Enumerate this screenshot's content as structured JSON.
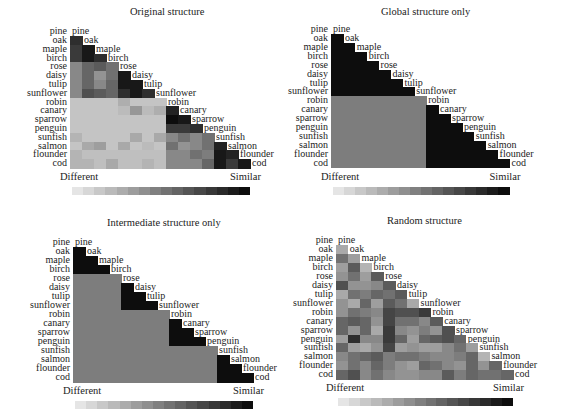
{
  "labels": [
    "pine",
    "oak",
    "maple",
    "birch",
    "rose",
    "daisy",
    "tulip",
    "sunflower",
    "robin",
    "canary",
    "sparrow",
    "penguin",
    "sunfish",
    "salmon",
    "flounder",
    "cod"
  ],
  "legend": {
    "left": "Different",
    "right": "Similar",
    "steps": 16
  },
  "colors": {
    "light": "#ececec",
    "dark": "#0d0d0d"
  },
  "panels": [
    {
      "title": "Original structure"
    },
    {
      "title": "Global structure only"
    },
    {
      "title": "Intermediate structure only"
    },
    {
      "title": "Random structure"
    }
  ],
  "chart_data": [
    {
      "type": "heatmap",
      "title": "Original structure",
      "layout": "lower-triangular similarity matrix",
      "row_labels": [
        "oak",
        "maple",
        "birch",
        "rose",
        "daisy",
        "tulip",
        "sunflower",
        "robin",
        "canary",
        "sparrow",
        "penguin",
        "sunfish",
        "salmon",
        "flounder",
        "cod"
      ],
      "col_labels": [
        "pine",
        "oak",
        "maple",
        "birch",
        "rose",
        "daisy",
        "tulip",
        "sunflower",
        "robin",
        "canary",
        "sparrow",
        "penguin",
        "sunfish",
        "salmon",
        "flounder"
      ],
      "scale": {
        "min_label": "Different",
        "max_label": "Similar",
        "range": [
          0,
          1
        ]
      },
      "values": [
        [
          0.85
        ],
        [
          0.8,
          0.95
        ],
        [
          0.8,
          0.95,
          0.85
        ],
        [
          0.45,
          0.6,
          0.65,
          0.55
        ],
        [
          0.45,
          0.6,
          0.4,
          0.55,
          0.95
        ],
        [
          0.45,
          0.6,
          0.45,
          0.6,
          0.95,
          0.95
        ],
        [
          0.45,
          0.7,
          0.65,
          0.6,
          0.85,
          0.95,
          0.85
        ],
        [
          0.18,
          0.18,
          0.18,
          0.18,
          0.28,
          0.18,
          0.18,
          0.18
        ],
        [
          0.18,
          0.18,
          0.18,
          0.18,
          0.22,
          0.38,
          0.22,
          0.28,
          0.9
        ],
        [
          0.18,
          0.18,
          0.18,
          0.18,
          0.18,
          0.18,
          0.18,
          0.18,
          1.0,
          0.95
        ],
        [
          0.18,
          0.18,
          0.18,
          0.18,
          0.18,
          0.18,
          0.18,
          0.18,
          0.8,
          0.8,
          0.85
        ],
        [
          0.25,
          0.18,
          0.18,
          0.18,
          0.18,
          0.3,
          0.18,
          0.3,
          0.45,
          0.55,
          0.45,
          0.55
        ],
        [
          0.18,
          0.3,
          0.35,
          0.18,
          0.3,
          0.18,
          0.22,
          0.18,
          0.55,
          0.4,
          0.45,
          0.55,
          0.9
        ],
        [
          0.25,
          0.2,
          0.2,
          0.2,
          0.2,
          0.2,
          0.2,
          0.2,
          0.45,
          0.45,
          0.55,
          0.5,
          0.95,
          0.9
        ],
        [
          0.25,
          0.25,
          0.2,
          0.3,
          0.2,
          0.2,
          0.25,
          0.2,
          0.45,
          0.45,
          0.45,
          0.6,
          0.95,
          0.8,
          0.95
        ]
      ]
    },
    {
      "type": "heatmap",
      "title": "Global structure only",
      "layout": "lower-triangular similarity matrix",
      "row_labels": [
        "oak",
        "maple",
        "birch",
        "rose",
        "daisy",
        "tulip",
        "sunflower",
        "robin",
        "canary",
        "sparrow",
        "penguin",
        "sunfish",
        "salmon",
        "flounder",
        "cod"
      ],
      "col_labels": [
        "pine",
        "oak",
        "maple",
        "birch",
        "rose",
        "daisy",
        "tulip",
        "sunflower",
        "robin",
        "canary",
        "sparrow",
        "penguin",
        "sunfish",
        "salmon",
        "flounder"
      ],
      "scale": {
        "min_label": "Different",
        "max_label": "Similar",
        "range": [
          0,
          1
        ]
      },
      "values": [
        [
          1
        ],
        [
          1,
          1
        ],
        [
          1,
          1,
          1
        ],
        [
          1,
          1,
          1,
          1
        ],
        [
          1,
          1,
          1,
          1,
          1
        ],
        [
          1,
          1,
          1,
          1,
          1,
          1
        ],
        [
          1,
          1,
          1,
          1,
          1,
          1,
          1
        ],
        [
          0.5,
          0.5,
          0.5,
          0.5,
          0.5,
          0.5,
          0.5,
          0.5
        ],
        [
          0.5,
          0.5,
          0.5,
          0.5,
          0.5,
          0.5,
          0.5,
          0.5,
          1
        ],
        [
          0.5,
          0.5,
          0.5,
          0.5,
          0.5,
          0.5,
          0.5,
          0.5,
          1,
          1
        ],
        [
          0.5,
          0.5,
          0.5,
          0.5,
          0.5,
          0.5,
          0.5,
          0.5,
          1,
          1,
          1
        ],
        [
          0.5,
          0.5,
          0.5,
          0.5,
          0.5,
          0.5,
          0.5,
          0.5,
          1,
          1,
          1,
          1
        ],
        [
          0.5,
          0.5,
          0.5,
          0.5,
          0.5,
          0.5,
          0.5,
          0.5,
          1,
          1,
          1,
          1,
          1
        ],
        [
          0.5,
          0.5,
          0.5,
          0.5,
          0.5,
          0.5,
          0.5,
          0.5,
          1,
          1,
          1,
          1,
          1,
          1
        ],
        [
          0.5,
          0.5,
          0.5,
          0.5,
          0.5,
          0.5,
          0.5,
          0.5,
          1,
          1,
          1,
          1,
          1,
          1,
          1
        ]
      ]
    },
    {
      "type": "heatmap",
      "title": "Intermediate structure only",
      "layout": "lower-triangular similarity matrix",
      "row_labels": [
        "oak",
        "maple",
        "birch",
        "rose",
        "daisy",
        "tulip",
        "sunflower",
        "robin",
        "canary",
        "sparrow",
        "penguin",
        "sunfish",
        "salmon",
        "flounder",
        "cod"
      ],
      "col_labels": [
        "pine",
        "oak",
        "maple",
        "birch",
        "rose",
        "daisy",
        "tulip",
        "sunflower",
        "robin",
        "canary",
        "sparrow",
        "penguin",
        "sunfish",
        "salmon",
        "flounder"
      ],
      "scale": {
        "min_label": "Different",
        "max_label": "Similar",
        "range": [
          0,
          1
        ]
      },
      "values": [
        [
          1
        ],
        [
          1,
          1
        ],
        [
          1,
          1,
          1
        ],
        [
          0.5,
          0.5,
          0.5,
          0.5
        ],
        [
          0.5,
          0.5,
          0.5,
          0.5,
          1
        ],
        [
          0.5,
          0.5,
          0.5,
          0.5,
          1,
          1
        ],
        [
          0.5,
          0.5,
          0.5,
          0.5,
          1,
          1,
          1
        ],
        [
          0.5,
          0.5,
          0.5,
          0.5,
          0.5,
          0.5,
          0.5,
          0.5
        ],
        [
          0.5,
          0.5,
          0.5,
          0.5,
          0.5,
          0.5,
          0.5,
          0.5,
          1
        ],
        [
          0.5,
          0.5,
          0.5,
          0.5,
          0.5,
          0.5,
          0.5,
          0.5,
          1,
          1
        ],
        [
          0.5,
          0.5,
          0.5,
          0.5,
          0.5,
          0.5,
          0.5,
          0.5,
          1,
          1,
          1
        ],
        [
          0.5,
          0.5,
          0.5,
          0.5,
          0.5,
          0.5,
          0.5,
          0.5,
          0.5,
          0.5,
          0.5,
          0.5
        ],
        [
          0.5,
          0.5,
          0.5,
          0.5,
          0.5,
          0.5,
          0.5,
          0.5,
          0.5,
          0.5,
          0.5,
          0.5,
          1
        ],
        [
          0.5,
          0.5,
          0.5,
          0.5,
          0.5,
          0.5,
          0.5,
          0.5,
          0.5,
          0.5,
          0.5,
          0.5,
          1,
          1
        ],
        [
          0.5,
          0.5,
          0.5,
          0.5,
          0.5,
          0.5,
          0.5,
          0.5,
          0.5,
          0.5,
          0.5,
          0.5,
          1,
          1,
          1
        ]
      ]
    },
    {
      "type": "heatmap",
      "title": "Random structure",
      "layout": "lower-triangular similarity matrix",
      "row_labels": [
        "oak",
        "maple",
        "birch",
        "rose",
        "daisy",
        "tulip",
        "sunflower",
        "robin",
        "canary",
        "sparrow",
        "penguin",
        "sunfish",
        "salmon",
        "flounder",
        "cod"
      ],
      "col_labels": [
        "pine",
        "oak",
        "maple",
        "birch",
        "rose",
        "daisy",
        "tulip",
        "sunflower",
        "robin",
        "canary",
        "sparrow",
        "penguin",
        "sunfish",
        "salmon",
        "flounder"
      ],
      "scale": {
        "min_label": "Different",
        "max_label": "Similar",
        "range": [
          0,
          1
        ]
      },
      "values": [
        [
          0.3
        ],
        [
          0.55,
          0.35
        ],
        [
          0.35,
          0.65,
          0.25
        ],
        [
          0.4,
          0.55,
          0.35,
          0.65
        ],
        [
          0.7,
          0.4,
          0.4,
          0.45,
          0.65
        ],
        [
          0.3,
          0.55,
          0.5,
          0.6,
          0.55,
          0.65
        ],
        [
          0.4,
          0.3,
          0.6,
          0.35,
          0.65,
          0.55,
          0.3
        ],
        [
          0.4,
          0.55,
          0.5,
          0.45,
          0.75,
          0.7,
          0.7,
          0.8
        ],
        [
          0.6,
          0.65,
          0.6,
          0.4,
          0.75,
          0.55,
          0.55,
          0.45,
          0.65
        ],
        [
          0.6,
          0.4,
          0.6,
          0.3,
          0.8,
          0.45,
          0.4,
          0.5,
          0.4,
          0.7
        ],
        [
          0.35,
          0.85,
          0.45,
          0.45,
          0.8,
          0.6,
          0.35,
          0.6,
          0.65,
          0.7,
          0.6
        ],
        [
          0.6,
          0.35,
          0.3,
          0.4,
          0.75,
          0.35,
          0.4,
          0.35,
          0.35,
          0.45,
          0.55,
          0.35
        ],
        [
          0.45,
          0.55,
          0.6,
          0.65,
          0.5,
          0.55,
          0.55,
          0.5,
          0.45,
          0.45,
          0.5,
          0.6,
          0.25
        ],
        [
          0.4,
          0.55,
          0.45,
          0.6,
          0.5,
          0.4,
          0.35,
          0.6,
          0.55,
          0.45,
          0.4,
          0.6,
          0.4,
          0.6
        ],
        [
          0.6,
          0.7,
          0.45,
          0.55,
          0.45,
          0.4,
          0.4,
          0.45,
          0.45,
          0.65,
          0.5,
          0.6,
          0.55,
          0.55,
          0.6
        ]
      ]
    }
  ]
}
